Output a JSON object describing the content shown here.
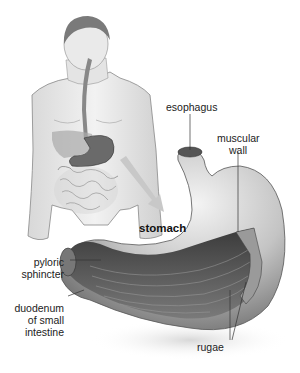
{
  "diagram": {
    "labels": {
      "esophagus": "esophagus",
      "muscular_wall_1": "muscular",
      "muscular_wall_2": "wall",
      "stomach": "stomach",
      "pyloric_1": "pyloric",
      "pyloric_2": "sphincter",
      "duodenum_1": "duodenum",
      "duodenum_2": "of small",
      "duodenum_3": "intestine",
      "rugae": "rugae"
    },
    "colors": {
      "background": "#ffffff",
      "text": "#222222",
      "arrow": "#c8c8c8",
      "skin": "#e6e6e6",
      "stomach_shade": "#8a8a8a",
      "interior": "#555555",
      "leader_line": "#333333"
    }
  }
}
